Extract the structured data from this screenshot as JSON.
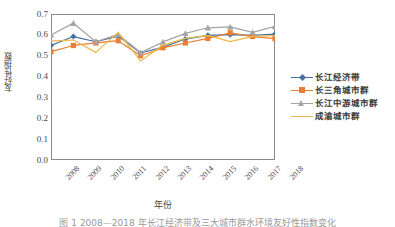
{
  "chart_data": {
    "type": "line",
    "title": "",
    "xlabel": "年份",
    "ylabel": "友好性指数",
    "categories": [
      "2008",
      "2009",
      "2010",
      "2011",
      "2012",
      "2013",
      "2014",
      "2015",
      "2016",
      "2017",
      "2018"
    ],
    "x": [
      2008,
      2009,
      2010,
      2011,
      2012,
      2013,
      2014,
      2015,
      2016,
      2017,
      2018
    ],
    "ylim": [
      0.0,
      0.7
    ],
    "xlim": [
      2008,
      2018
    ],
    "yticks": [
      "0.0",
      "0.1",
      "0.2",
      "0.3",
      "0.4",
      "0.5",
      "0.6",
      "0.7"
    ],
    "ytick_values": [
      0.0,
      0.1,
      0.2,
      0.3,
      0.4,
      0.5,
      0.6,
      0.7
    ],
    "grid": false,
    "legend_position": "right",
    "series": [
      {
        "name": "长江经济带",
        "color": "#4472a4",
        "marker": "diamond",
        "values": [
          0.549,
          0.592,
          0.567,
          0.594,
          0.513,
          0.541,
          0.58,
          0.598,
          0.601,
          0.598,
          0.604
        ]
      },
      {
        "name": "长三角城市群",
        "color": "#ed7d31",
        "marker": "square",
        "values": [
          0.519,
          0.549,
          0.561,
          0.572,
          0.5,
          0.538,
          0.561,
          0.583,
          0.61,
          0.592,
          0.582
        ]
      },
      {
        "name": "长江中游城市群",
        "color": "#a5a5a5",
        "marker": "triangle",
        "values": [
          0.6,
          0.656,
          0.567,
          0.602,
          0.515,
          0.566,
          0.607,
          0.634,
          0.638,
          0.612,
          0.641
        ]
      },
      {
        "name": "成渝城市群",
        "color": "#ecb94a",
        "marker": "none",
        "values": [
          0.571,
          0.575,
          0.516,
          0.612,
          0.475,
          0.551,
          0.583,
          0.598,
          0.568,
          0.593,
          0.596
        ]
      }
    ]
  },
  "axes": {
    "y_title": "友好性指数",
    "x_title": "年份"
  },
  "legend": {
    "items": [
      {
        "label": "长江经济带"
      },
      {
        "label": "长三角城市群"
      },
      {
        "label": "长江中游城市群"
      },
      {
        "label": "成渝城市群"
      }
    ]
  },
  "caption": {
    "text": "图 1  2008—2018 年长江经济带及三大城市群水环境友好性指数变化"
  }
}
